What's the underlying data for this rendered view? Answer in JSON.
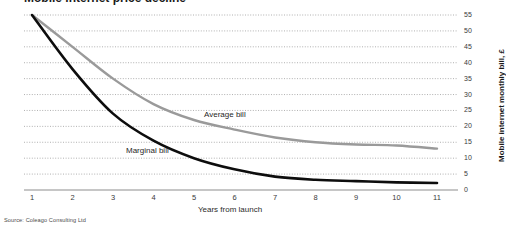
{
  "figure": {
    "title_partial": "Mobile internet price decline",
    "source": "Source: Coleago Consulting Ltd"
  },
  "chart_data": {
    "type": "line",
    "title": "",
    "xlabel": "Years from launch",
    "ylabel": "Mobile internet monthly bill, £",
    "x": [
      1,
      2,
      3,
      4,
      5,
      6,
      7,
      8,
      9,
      10,
      11
    ],
    "xticklabels": [
      "1",
      "2",
      "3",
      "4",
      "5",
      "6",
      "7",
      "8",
      "9",
      "10",
      "11"
    ],
    "yticklabels": [
      "0",
      "5",
      "10",
      "15",
      "20",
      "25",
      "30",
      "35",
      "40",
      "45",
      "50",
      "55"
    ],
    "yticks": [
      0,
      5,
      10,
      15,
      20,
      25,
      30,
      35,
      40,
      45,
      50,
      55
    ],
    "xlim": [
      1,
      11
    ],
    "ylim": [
      0,
      55
    ],
    "grid": true,
    "grid_style": "dotted-horizontal",
    "legend": "inline-labels",
    "series": [
      {
        "name": "Average bill",
        "color": "#9a9a9a",
        "values": [
          55,
          45,
          35,
          27,
          22,
          19,
          16.5,
          15,
          14.3,
          14,
          13
        ]
      },
      {
        "name": "Marginal bill",
        "color": "#0d0d0d",
        "values": [
          55,
          38,
          24,
          15.5,
          10,
          6.5,
          4.2,
          3.2,
          2.8,
          2.4,
          2.2
        ]
      }
    ]
  },
  "axes": {
    "baseline_color": "#b3b3b3",
    "gridline_color": "#9d9d9d"
  }
}
